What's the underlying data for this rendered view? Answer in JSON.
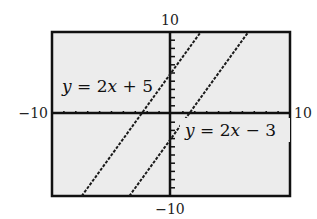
{
  "chart_data": {
    "type": "line",
    "title": "",
    "xlabel": "",
    "ylabel": "",
    "xlim": [
      -10,
      10
    ],
    "ylim": [
      -10,
      10
    ],
    "grid": false,
    "window_labels": {
      "ymax": "10",
      "ymin": "−10",
      "xmin": "−10",
      "xmax": "10"
    },
    "series": [
      {
        "name": "y = 2x + 5",
        "equation": "y = 2x + 5",
        "slope": 2,
        "intercept": 5,
        "x": [
          -7.5,
          2.5
        ],
        "y": [
          -10,
          10
        ]
      },
      {
        "name": "y = 2x − 3",
        "equation": "y = 2x − 3",
        "slope": 2,
        "intercept": -3,
        "x": [
          -3.5,
          6.5
        ],
        "y": [
          -10,
          10
        ]
      }
    ],
    "annotations": [
      {
        "text": "y = 2x + 5",
        "position": "upper-left, near line 1"
      },
      {
        "text": "y = 2x − 3",
        "position": "lower-right, below x-axis near line 2"
      }
    ],
    "tick_marks": {
      "x_step": 1,
      "y_step": 1
    }
  },
  "labels": {
    "ymax": "10",
    "ymin": "−10",
    "xmin": "−10",
    "xmax": "10",
    "eq1_y": "y",
    "eq1_rest": " = 2",
    "eq1_x": "x",
    "eq1_tail": " + 5",
    "eq2_y": "y",
    "eq2_rest": " = 2",
    "eq2_x": "x",
    "eq2_tail": " − 3"
  },
  "colors": {
    "screen_bg": "#ececec",
    "frame": "#111111",
    "line": "#1a1a1a"
  }
}
